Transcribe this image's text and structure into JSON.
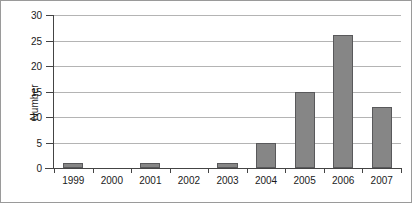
{
  "chart_data": {
    "type": "bar",
    "title": "",
    "xlabel": "",
    "ylabel": "Number",
    "categories": [
      "1999",
      "2000",
      "2001",
      "2002",
      "2003",
      "2004",
      "2005",
      "2006",
      "2007"
    ],
    "values": [
      1,
      0,
      1,
      0,
      1,
      5,
      15,
      26,
      12
    ],
    "ylim": [
      0,
      30
    ],
    "yticks": [
      0,
      5,
      10,
      15,
      20,
      25,
      30
    ],
    "ytick_labels": [
      "0",
      "5",
      "10",
      "15",
      "20",
      "25",
      "30"
    ],
    "grid": true,
    "grid_axis": "y",
    "legend": false,
    "legend_position": "none",
    "series": [
      {
        "name": "Number",
        "values": [
          1,
          0,
          1,
          0,
          1,
          5,
          15,
          26,
          12
        ]
      }
    ],
    "colors": {
      "bar_fill": "#868686",
      "bar_edge": "#59595b",
      "gridline": "#b4b4b4",
      "axis": "#444444",
      "text": "#1a1a1a",
      "background": "#ffffff",
      "frame": "#9a9a9a"
    }
  }
}
